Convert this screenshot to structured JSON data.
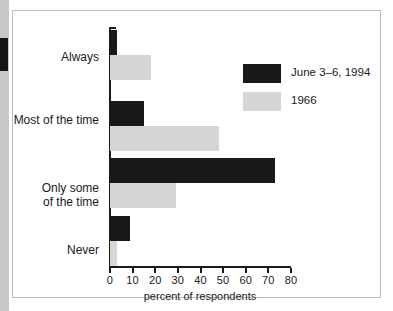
{
  "chart_data": {
    "type": "bar",
    "orientation": "horizontal",
    "title": "",
    "xlabel": "percent of respondents",
    "ylabel": "",
    "xlim": [
      0,
      80
    ],
    "xticks": [
      0,
      10,
      20,
      30,
      40,
      50,
      60,
      70,
      80
    ],
    "grid": false,
    "legend_position": "upper right",
    "categories": [
      "Always",
      "Most of the time",
      "Only some\nof the time",
      "Never"
    ],
    "series": [
      {
        "name": "June 3–6, 1994",
        "color": "#181818",
        "values": [
          3,
          15,
          73,
          9
        ]
      },
      {
        "name": "1966",
        "color": "#d6d6d6",
        "values": [
          18,
          48,
          29,
          3
        ]
      }
    ]
  },
  "axis": {
    "tick_labels": [
      "0",
      "10",
      "20",
      "30",
      "40",
      "50",
      "60",
      "70",
      "80"
    ],
    "x_axis_title": "percent of respondents"
  },
  "legend": {
    "items": [
      {
        "label": "June 3–6, 1994",
        "swatch": "#181818"
      },
      {
        "label": "1966",
        "swatch": "#d6d6d6"
      }
    ]
  },
  "categories": [
    {
      "label": "Always"
    },
    {
      "label": "Most of the time"
    },
    {
      "label": "Only some\nof the time"
    },
    {
      "label": "Never"
    }
  ]
}
